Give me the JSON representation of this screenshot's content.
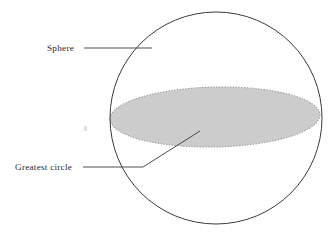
{
  "figure": {
    "background_color": "#ffffff",
    "width": 336,
    "height": 233
  },
  "shapes": {
    "sphere": {
      "name": "Sphere outline circle",
      "center_x": 216,
      "center_y": 118,
      "radius": 106,
      "stroke_color": "#3a3a3a",
      "stroke_width": 1,
      "fill": "none"
    },
    "greatest_circle": {
      "name": "Greatest circle ellipse",
      "center_x": 215,
      "center_y": 117,
      "radius_x": 105,
      "radius_y": 30,
      "rotation_deg": -1.2,
      "fill_color": "#cccccc",
      "stroke_color": "#9a9a9a",
      "stroke_dash": "1.4 1.4",
      "stroke_width": 1
    },
    "artifact_mark": {
      "name": "faint speck",
      "x": 85,
      "y": 128,
      "color": "#e2e2e2"
    }
  },
  "labels": [
    {
      "id": "sphere",
      "text": "Sphere",
      "text_x": 47,
      "text_y": 51,
      "leader": {
        "name": "sphere-leader-line",
        "x1": 84,
        "y1": 48,
        "x2": 152,
        "y2": 48,
        "color": "#3a3a3a"
      }
    },
    {
      "id": "greatest-circle",
      "text": "Greatest circle",
      "text_x": 15,
      "text_y": 170,
      "leader": {
        "name": "greatest-circle-leader-line",
        "x1": 83,
        "y1": 167,
        "x2": 143,
        "y2": 167,
        "x3": 200,
        "y3": 131,
        "color": "#3a3a3a"
      }
    }
  ]
}
